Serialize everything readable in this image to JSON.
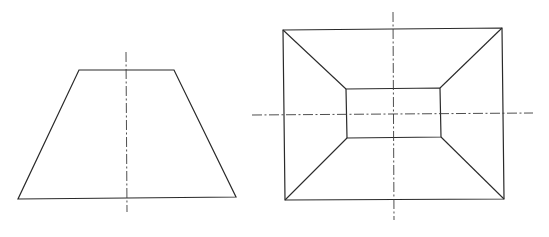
{
  "diagram": {
    "type": "orthographic-projection",
    "colors": {
      "background": "#ffffff",
      "line": "#2a2a2a",
      "centerline": "#3a3a3a"
    },
    "views": [
      {
        "name": "front-view",
        "shape": "trapezoid",
        "points": "79,70 174,70 236,197 18,199",
        "centerlines": [
          {
            "orientation": "vertical",
            "x1": 126,
            "y1": 52,
            "x2": 127,
            "y2": 212
          }
        ]
      },
      {
        "name": "top-view",
        "shape": "frustum-plan",
        "outer": "283,30 502,28 504,199 285,200",
        "inner": "346,89 440,88 441,137 347,138",
        "edges": [
          {
            "x1": 283,
            "y1": 30,
            "x2": 346,
            "y2": 89
          },
          {
            "x1": 502,
            "y1": 28,
            "x2": 440,
            "y2": 88
          },
          {
            "x1": 504,
            "y1": 199,
            "x2": 441,
            "y2": 137
          },
          {
            "x1": 285,
            "y1": 200,
            "x2": 347,
            "y2": 138
          }
        ],
        "centerlines": [
          {
            "orientation": "vertical",
            "x1": 393,
            "y1": 12,
            "x2": 394,
            "y2": 220
          },
          {
            "orientation": "horizontal",
            "x1": 252,
            "y1": 115,
            "x2": 533,
            "y2": 113
          }
        ]
      }
    ]
  }
}
